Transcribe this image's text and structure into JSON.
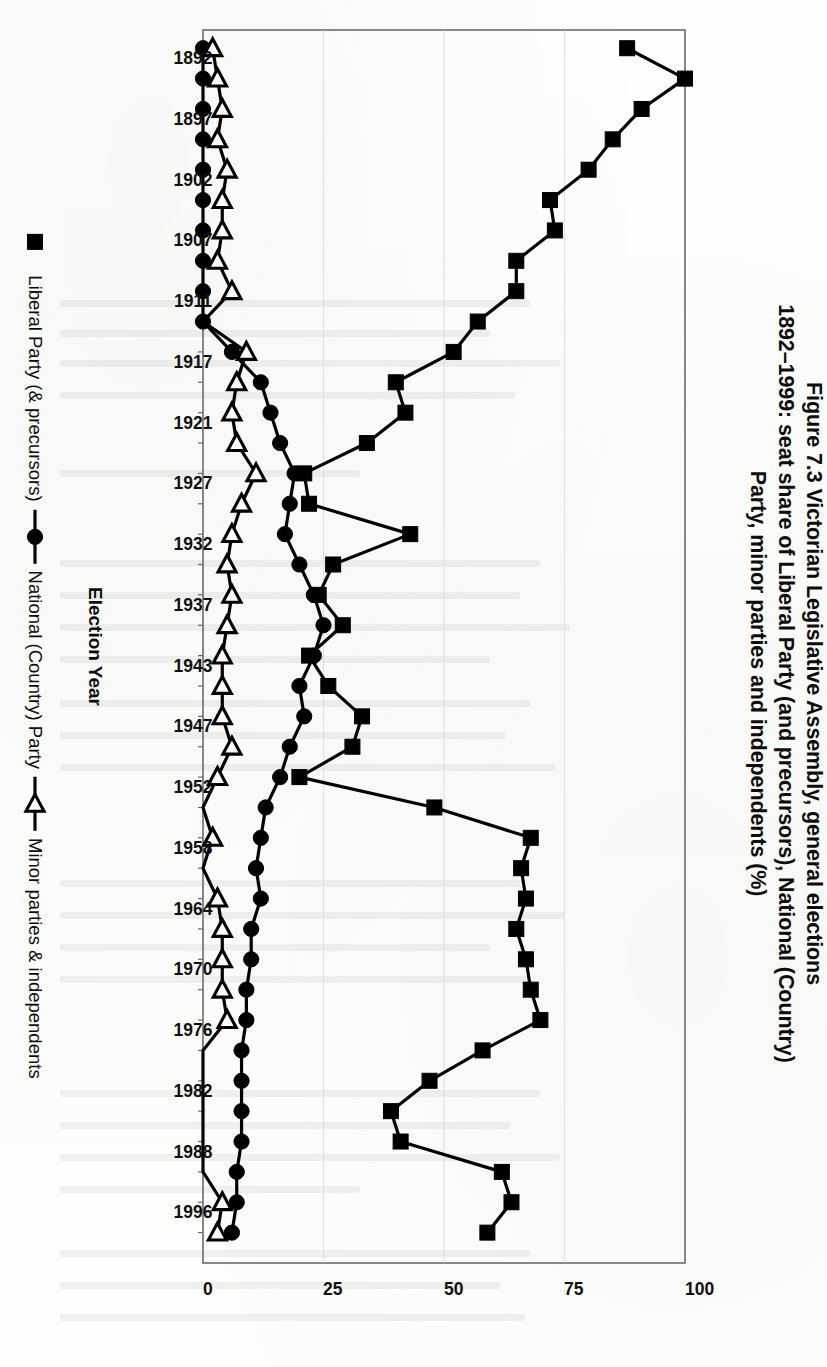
{
  "figure": {
    "title_lines": [
      "Figure 7.3  Victorian Legislative Assembly, general elections",
      "1892–1999: seat share of Liberal Party (and precursors), National (Country)",
      "Party, minor parties and independents (%)"
    ],
    "title_full": "Figure 7.3 Victorian Legislative Assembly, general elections 1892–1999: seat share of Liberal Party (and precursors), National (Country) Party, minor parties and independents (%)",
    "rotation_degrees": 90,
    "orientation_note": "landscape-chart-rotated-90-on-portrait-page"
  },
  "chart_data": {
    "type": "line",
    "title": "Figure 7.3  Victorian Legislative Assembly, general elections 1892–1999: seat share of Liberal Party (and precursors), National (Country) Party, minor parties and independents (%)",
    "xlabel": "Election Year",
    "ylabel": "",
    "ylim": [
      0,
      100
    ],
    "yticks": [
      0,
      25,
      50,
      75,
      100
    ],
    "ytick_labels": [
      "0",
      "25",
      "50",
      "75",
      "100"
    ],
    "grid": false,
    "legend_position": "bottom",
    "x": [
      1892,
      1894,
      1897,
      1900,
      1902,
      1904,
      1907,
      1908,
      1911,
      1914,
      1917,
      1920,
      1921,
      1924,
      1927,
      1929,
      1932,
      1935,
      1937,
      1940,
      1943,
      1945,
      1947,
      1950,
      1952,
      1955,
      1958,
      1961,
      1964,
      1967,
      1970,
      1973,
      1976,
      1979,
      1982,
      1985,
      1988,
      1992,
      1996,
      1999
    ],
    "xtick_labels": [
      "1892",
      "1897",
      "1902",
      "1907",
      "1911",
      "1917",
      "1921",
      "1927",
      "1932",
      "1937",
      "1943",
      "1947",
      "1952",
      "1958",
      "1964",
      "1970",
      "1976",
      "1982",
      "1988",
      "1996"
    ],
    "series": [
      {
        "name": "Liberal Party (& precursors)",
        "marker": "filled-square",
        "color": "#000000",
        "values": [
          88,
          100,
          91,
          85,
          80,
          72,
          73,
          65,
          65,
          57,
          52,
          40,
          42,
          34,
          21,
          22,
          43,
          27,
          24,
          29,
          22,
          26,
          33,
          31,
          20,
          48,
          68,
          66,
          67,
          65,
          67,
          68,
          70,
          58,
          47,
          39,
          41,
          62,
          64,
          59
        ]
      },
      {
        "name": "National (Country) Party",
        "marker": "filled-circle",
        "color": "#000000",
        "values": [
          0,
          0,
          0,
          0,
          0,
          0,
          0,
          0,
          0,
          0,
          6,
          12,
          14,
          16,
          19,
          18,
          17,
          20,
          23,
          25,
          23,
          20,
          21,
          18,
          16,
          13,
          12,
          11,
          12,
          10,
          10,
          9,
          9,
          8,
          8,
          8,
          8,
          7,
          7,
          6
        ]
      },
      {
        "name": "Minor parties & independents",
        "marker": "open-triangle-left",
        "color": "#000000",
        "values": [
          2,
          3,
          4,
          3,
          5,
          4,
          4,
          3,
          6,
          0,
          9,
          7,
          6,
          7,
          11,
          8,
          6,
          5,
          6,
          5,
          4,
          4,
          4,
          6,
          3,
          0,
          2,
          0,
          3,
          4,
          4,
          4,
          5,
          0,
          0,
          0,
          0,
          0,
          4,
          3
        ]
      }
    ],
    "legend": [
      {
        "label": "Liberal Party (& precursors)",
        "marker": "filled-square"
      },
      {
        "label": "National (Country) Party",
        "marker": "filled-circle"
      },
      {
        "label": "Minor parties & independents",
        "marker": "open-triangle-left"
      }
    ]
  }
}
